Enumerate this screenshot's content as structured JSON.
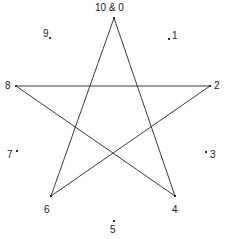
{
  "figure": {
    "background_color": "#ffffff",
    "line_color": "#3a3a3a",
    "text_color": "#1a1a1a",
    "marker_color": "#2b2b2b"
  },
  "chart_data": {
    "type": "diagram",
    "title": "",
    "grid": false,
    "legend": null,
    "star_points": [
      {
        "label": "10 & 0",
        "value": 0,
        "x": 114,
        "y": 18,
        "label_x": 95,
        "label_y": 3,
        "has_dot": true
      },
      {
        "label": "2",
        "value": 2,
        "x": 210,
        "y": 86,
        "label_x": 214,
        "label_y": 81,
        "has_dot": true
      },
      {
        "label": "4",
        "value": 4,
        "x": 175,
        "y": 196,
        "label_x": 172,
        "label_y": 205,
        "has_dot": true
      },
      {
        "label": "6",
        "value": 6,
        "x": 51,
        "y": 196,
        "label_x": 44,
        "label_y": 205,
        "has_dot": true
      },
      {
        "label": "8",
        "value": 8,
        "x": 16,
        "y": 86,
        "label_x": 5,
        "label_y": 81,
        "has_dot": true
      }
    ],
    "tick_points": [
      {
        "label": "1",
        "value": 1,
        "dot_x": 168,
        "dot_y": 38,
        "label_x": 172,
        "label_y": 31
      },
      {
        "label": "3",
        "value": 3,
        "dot_x": 205,
        "dot_y": 151,
        "label_x": 210,
        "label_y": 150
      },
      {
        "label": "5",
        "value": 5,
        "dot_x": 113,
        "dot_y": 220,
        "label_x": 110,
        "label_y": 225
      },
      {
        "label": "7",
        "value": 7,
        "dot_x": 16,
        "dot_y": 150,
        "label_x": 7,
        "label_y": 150
      },
      {
        "label": "9",
        "value": 9,
        "dot_x": 49,
        "dot_y": 37,
        "label_x": 43,
        "label_y": 29
      }
    ],
    "edges": [
      {
        "from": "10 & 0",
        "to": "4"
      },
      {
        "from": "4",
        "to": "8"
      },
      {
        "from": "8",
        "to": "2"
      },
      {
        "from": "2",
        "to": "6"
      },
      {
        "from": "6",
        "to": "10 & 0"
      }
    ],
    "step": 4,
    "modulus": 10
  }
}
